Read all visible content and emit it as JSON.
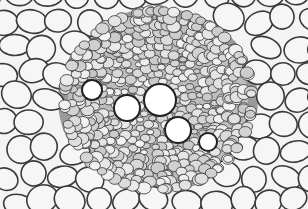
{
  "image": {
    "description": "Grayscale micrograph cross-section of a plant vascular bundle surrounded by parenchyma cells",
    "width": 308,
    "height": 209,
    "colors": {
      "background": "#f4f4f4",
      "cell_wall": "#3a3a3a",
      "cell_fill": "#f6f6f6",
      "bundle_dark": "#555555",
      "vessel_fill": "#ffffff"
    },
    "bundle_center": {
      "x": 158,
      "y": 100
    },
    "large_vessels": [
      {
        "x": 160,
        "y": 100,
        "r": 15
      },
      {
        "x": 127,
        "y": 108,
        "r": 12
      },
      {
        "x": 178,
        "y": 130,
        "r": 12
      },
      {
        "x": 92,
        "y": 90,
        "r": 9
      },
      {
        "x": 208,
        "y": 142,
        "r": 8
      }
    ]
  }
}
